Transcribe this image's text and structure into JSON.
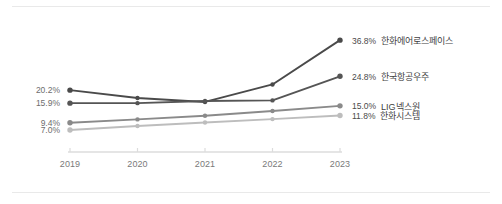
{
  "chart_data": {
    "type": "line",
    "title": "",
    "subtitle": "",
    "xlabel": "",
    "ylabel": "",
    "categories": [
      "2019",
      "2020",
      "2021",
      "2022",
      "2023"
    ],
    "ylim": [
      5.0,
      38.5
    ],
    "grid": false,
    "legend_position": "right-endpoint-labels",
    "value_suffix": "%",
    "series": [
      {
        "name": "한화에어로스페이스",
        "color": "#4a4a4a",
        "values": [
          20.2,
          17.6,
          16.3,
          22.1,
          36.8
        ],
        "start_label": "20.2%",
        "end_label": "36.8%"
      },
      {
        "name": "한국항공우주",
        "color": "#555555",
        "values": [
          15.9,
          15.9,
          16.6,
          16.8,
          24.8
        ],
        "start_label": "15.9%",
        "end_label": "24.8%"
      },
      {
        "name": "LIG넥스원",
        "color": "#8a8a8a",
        "values": [
          9.4,
          10.5,
          11.7,
          13.3,
          15.0
        ],
        "start_label": "9.4%",
        "end_label": "15.0%"
      },
      {
        "name": "한화시스템",
        "color": "#bdbdbd",
        "values": [
          7.0,
          8.3,
          9.5,
          10.6,
          11.8
        ],
        "start_label": "7.0%",
        "end_label": "11.8%"
      }
    ]
  },
  "axis": {
    "ticks": [
      "2019",
      "2020",
      "2021",
      "2022",
      "2023"
    ],
    "line_color": "#dcdcdc"
  },
  "left_labels": [
    {
      "text": "20.2%"
    },
    {
      "text": "15.9%"
    },
    {
      "text": "9.4%"
    },
    {
      "text": "7.0%"
    }
  ],
  "right_labels": [
    {
      "value": "36.8%",
      "name": "한화에어로스페이스"
    },
    {
      "value": "24.8%",
      "name": "한국항공우주"
    },
    {
      "value": "15.0%",
      "name": "LIG넥스원"
    },
    {
      "value": "11.8%",
      "name": "한화시스템"
    }
  ]
}
